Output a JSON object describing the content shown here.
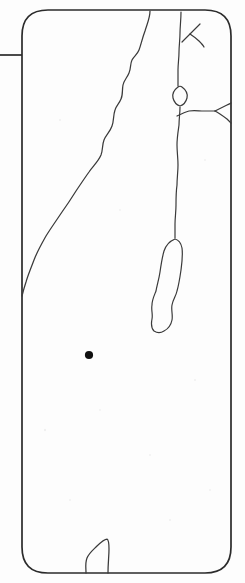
{
  "figure": {
    "kind": "line-drawing-map",
    "title": "",
    "caption": "",
    "background_color": "#fdfdfd",
    "ink_color": "#3a3a3a",
    "frame_color": "#2b2b2b",
    "marker_color": "#101010",
    "width": 245,
    "height": 583
  },
  "frame": {
    "name": "rounded-rectangle-map-border",
    "x": 22,
    "y": 10,
    "width": 209,
    "height": 563,
    "corner_radius": 26,
    "stroke_width": 1.7,
    "path": "M 48 10 L 205 10 Q 231 10 231 36 L 231 547 Q 231 573 205 573 L 48 573 Q 22 573 22 547 L 22 36 Q 22 10 48 10 Z"
  },
  "leader": {
    "name": "left-leader-line",
    "x1": 0,
    "y1": 55,
    "x2": 22,
    "y2": 55
  },
  "features": [
    {
      "id": "mediterranean-coastline",
      "label": "Mediterranean coastline",
      "type": "coastline",
      "stroke_width": 1.25,
      "path": "M 150 11 C 150 18, 147 24, 145 31 C 142 39, 141 45, 139 50 C 137 55, 134 56, 132 60 C 130 64, 131 69, 129 73 C 127 78, 124 80, 123 85 C 122 90, 123 95, 121 99 C 119 104, 116 106, 115 110 C 113 116, 114 121, 112 126 C 110 132, 106 135, 104 140 C 102 145, 103 150, 101 155 C 98 162, 93 166, 89 172 C 84 179, 80 185, 76 191 C 71 199, 67 205, 62 212 C 56 221, 51 228, 46 236 C 41 245, 37 252, 34 260 C 31 268, 28 275, 26 282 C 24 288, 23 292, 22 296"
    },
    {
      "id": "jordan-river-upper",
      "label": "Upper Jordan River",
      "type": "river",
      "stroke_width": 1.2,
      "path": "M 181 12 C 181 20, 180 27, 180 33 C 180 40, 179 46, 179 52 C 179 58, 178 64, 178 70 C 178 76, 178 81, 178 86"
    },
    {
      "id": "tributary-north-east",
      "label": "North-eastern tributary",
      "type": "river",
      "stroke_width": 1.1,
      "path": "M 182 42 C 185 39, 188 36, 191 33 C 194 30, 197 27, 200 24"
    },
    {
      "id": "tributary-east-branch",
      "label": "Eastern branch",
      "type": "river",
      "stroke_width": 1.1,
      "path": "M 190 34 C 193 36, 196 38, 199 41 C 201 43, 203 45, 204 47"
    },
    {
      "id": "sea-of-galilee",
      "label": "Sea of Galilee",
      "type": "lake",
      "stroke_width": 1.2,
      "path": "M 178 87 C 174 90, 172 94, 173 98 C 174 102, 177 105, 180 106 C 183 105, 186 102, 187 98 C 188 94, 186 90, 182 87 C 181 86, 179 86, 178 87 Z"
    },
    {
      "id": "jordan-river-lower",
      "label": "Lower Jordan River",
      "type": "river",
      "stroke_width": 1.2,
      "path": "M 180 107 C 180 113, 179 119, 179 125 C 178 132, 177 138, 177 145 C 177 152, 178 158, 178 165 C 178 172, 177 178, 177 185 C 176 192, 176 198, 176 205 C 176 212, 175 218, 175 224 C 175 230, 175 234, 175 238"
    },
    {
      "id": "dead-sea",
      "label": "Dead Sea",
      "type": "lake",
      "stroke_width": 1.2,
      "path": "M 175 239 C 170 241, 166 245, 164 251 C 162 258, 161 265, 160 272 C 159 279, 157 285, 156 291 C 154 296, 152 300, 152 305 C 151 310, 153 314, 152 319 C 151 324, 151 328, 154 331 C 157 333, 161 333, 164 331 C 168 329, 171 325, 172 320 C 173 315, 171 310, 172 305 C 173 299, 176 296, 177 291 C 179 284, 180 277, 181 270 C 182 262, 183 255, 182 248 C 181 243, 179 240, 175 239 Z"
    },
    {
      "id": "eastern-border-west-arm",
      "label": "Eastern border western arm",
      "type": "border",
      "stroke_width": 1.2,
      "path": "M 177 116 C 181 114, 185 112, 189 111 C 194 110, 199 111, 204 111 C 208 111, 212 111, 215 111"
    },
    {
      "id": "eastern-border-north-arm",
      "label": "Eastern border north arm",
      "type": "border",
      "stroke_width": 1.2,
      "path": "M 215 111 C 219 109, 223 107, 227 105 C 229 104, 230 104, 231 103"
    },
    {
      "id": "eastern-border-south-arm",
      "label": "Eastern border south arm",
      "type": "border",
      "stroke_width": 1.2,
      "path": "M 215 111 C 219 113, 223 116, 227 119 C 229 121, 230 122, 231 123"
    },
    {
      "id": "gulf-of-aqaba-inlet",
      "label": "Southern gulf inlet",
      "type": "coastline",
      "stroke_width": 1.2,
      "path": "M 86 573 C 86 568, 85 563, 87 558 C 89 553, 93 550, 97 546 C 101 542, 104 539, 107 539 C 109 540, 109 544, 109 549 C 109 556, 108 563, 108 573"
    }
  ],
  "markers": [
    {
      "id": "site-marker",
      "label": "Site location",
      "shape": "filled-circle",
      "cx": 89,
      "cy": 355,
      "r": 4.1,
      "color": "#101010"
    }
  ],
  "specks": [
    {
      "cx": 60,
      "cy": 120,
      "r": 1.1
    },
    {
      "cx": 205,
      "cy": 160,
      "r": 1.0
    },
    {
      "cx": 45,
      "cy": 430,
      "r": 1.2
    },
    {
      "cx": 150,
      "cy": 455,
      "r": 1.0
    },
    {
      "cx": 195,
      "cy": 380,
      "r": 1.1
    },
    {
      "cx": 70,
      "cy": 500,
      "r": 1.0
    },
    {
      "cx": 120,
      "cy": 210,
      "r": 0.9
    },
    {
      "cx": 210,
      "cy": 490,
      "r": 1.0
    },
    {
      "cx": 100,
      "cy": 410,
      "r": 0.9
    },
    {
      "cx": 170,
      "cy": 520,
      "r": 1.1
    }
  ]
}
